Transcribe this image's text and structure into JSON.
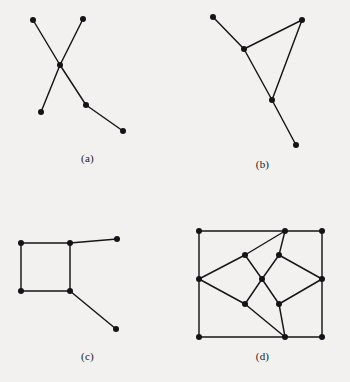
{
  "figure": {
    "background_color": "#f2f1ef",
    "ink_color": "#16161a",
    "vertex_color": "#141418",
    "vertex_radius": 3.0,
    "edge_width": 1.45
  },
  "panels": [
    {
      "id": "a",
      "caption": "(a)",
      "description": "Two crossing paths meeting at a shared center vertex",
      "vertex_count": 6,
      "edge_count": 5,
      "vertices": [
        {
          "name": "upper-left",
          "x": 33,
          "y": 20
        },
        {
          "name": "upper-right",
          "x": 83,
          "y": 19
        },
        {
          "name": "center",
          "x": 60,
          "y": 65
        },
        {
          "name": "lower-left",
          "x": 41,
          "y": 112
        },
        {
          "name": "mid-right",
          "x": 86,
          "y": 105
        },
        {
          "name": "far-right",
          "x": 123,
          "y": 131
        }
      ],
      "edges": [
        [
          0,
          2
        ],
        [
          1,
          2
        ],
        [
          2,
          3
        ],
        [
          2,
          4
        ],
        [
          4,
          5
        ]
      ]
    },
    {
      "id": "b",
      "caption": "(b)",
      "description": "Triangle with two pendant edges",
      "vertex_count": 5,
      "edge_count": 5,
      "vertices": [
        {
          "name": "top-left-pendant",
          "x": 38,
          "y": 17
        },
        {
          "name": "triangle-left",
          "x": 69,
          "y": 49
        },
        {
          "name": "triangle-right",
          "x": 127,
          "y": 20
        },
        {
          "name": "triangle-bottom",
          "x": 97,
          "y": 100
        },
        {
          "name": "bottom-pendant",
          "x": 121,
          "y": 145
        }
      ],
      "edges": [
        [
          0,
          1
        ],
        [
          1,
          2
        ],
        [
          1,
          3
        ],
        [
          2,
          3
        ],
        [
          3,
          4
        ]
      ]
    },
    {
      "id": "c",
      "caption": "(c)",
      "description": "Square cycle with two pendant edges",
      "vertex_count": 6,
      "edge_count": 6,
      "vertices": [
        {
          "name": "square-top-left",
          "x": 21,
          "y": 52
        },
        {
          "name": "square-top-right",
          "x": 70,
          "y": 52
        },
        {
          "name": "square-bottom-left",
          "x": 21,
          "y": 100
        },
        {
          "name": "square-bottom-right",
          "x": 70,
          "y": 100
        },
        {
          "name": "right-pendant",
          "x": 117,
          "y": 48
        },
        {
          "name": "lower-pendant",
          "x": 116,
          "y": 138
        }
      ],
      "edges": [
        [
          0,
          1
        ],
        [
          0,
          2
        ],
        [
          2,
          3
        ],
        [
          1,
          3
        ],
        [
          1,
          4
        ],
        [
          3,
          5
        ]
      ]
    },
    {
      "id": "d",
      "caption": "(d)",
      "description": "Rectangle with inscribed four-diamond rosette around a central vertex",
      "vertex_count": 13,
      "edge_count": 20,
      "vertices": [
        {
          "name": "rect-top-left",
          "x": 24,
          "y": 40
        },
        {
          "name": "rect-top-mid",
          "x": 110,
          "y": 40
        },
        {
          "name": "rect-top-right",
          "x": 147,
          "y": 40
        },
        {
          "name": "rect-mid-left",
          "x": 24,
          "y": 88
        },
        {
          "name": "rect-mid-right",
          "x": 147,
          "y": 88
        },
        {
          "name": "rect-bottom-left",
          "x": 24,
          "y": 146
        },
        {
          "name": "rect-bottom-mid",
          "x": 110,
          "y": 146
        },
        {
          "name": "rect-bottom-right",
          "x": 147,
          "y": 146
        },
        {
          "name": "diamond-upper-left",
          "x": 70,
          "y": 64
        },
        {
          "name": "diamond-upper-right",
          "x": 104,
          "y": 64
        },
        {
          "name": "diamond-center",
          "x": 87,
          "y": 88
        },
        {
          "name": "diamond-lower-left",
          "x": 70,
          "y": 113
        },
        {
          "name": "diamond-lower-right",
          "x": 104,
          "y": 113
        }
      ],
      "edges": [
        [
          0,
          1
        ],
        [
          1,
          2
        ],
        [
          0,
          3
        ],
        [
          3,
          5
        ],
        [
          2,
          4
        ],
        [
          4,
          7
        ],
        [
          5,
          6
        ],
        [
          6,
          7
        ],
        [
          1,
          8
        ],
        [
          1,
          9
        ],
        [
          6,
          11
        ],
        [
          6,
          12
        ],
        [
          3,
          8
        ],
        [
          3,
          11
        ],
        [
          4,
          9
        ],
        [
          4,
          12
        ],
        [
          8,
          10
        ],
        [
          9,
          10
        ],
        [
          11,
          10
        ],
        [
          12,
          10
        ]
      ]
    }
  ]
}
